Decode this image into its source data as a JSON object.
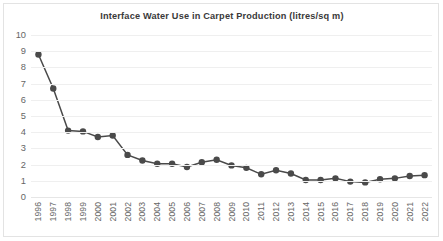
{
  "chart_data": {
    "type": "line",
    "title": "Interface Water Use in Carpet Production (litres/sq m)",
    "xlabel": "",
    "ylabel": "",
    "ylim": [
      0,
      10
    ],
    "yticks": [
      0,
      1,
      2,
      3,
      4,
      5,
      6,
      7,
      8,
      9,
      10
    ],
    "grid": true,
    "legend": false,
    "marker": "circle",
    "series_color": "#4a4a4a",
    "categories": [
      "1996",
      "1997",
      "1998",
      "1999",
      "2000",
      "2001",
      "2002",
      "2003",
      "2004",
      "2005",
      "2006",
      "2007",
      "2008",
      "2009",
      "2010",
      "2011",
      "2012",
      "2013",
      "2014",
      "2015",
      "2016",
      "2017",
      "2018",
      "2019",
      "2020",
      "2021",
      "2022"
    ],
    "values": [
      8.8,
      6.7,
      4.1,
      4.05,
      3.7,
      3.8,
      2.6,
      2.25,
      2.05,
      2.05,
      1.85,
      2.15,
      2.3,
      1.95,
      1.8,
      1.4,
      1.65,
      1.45,
      1.05,
      1.05,
      1.15,
      0.95,
      0.9,
      1.1,
      1.15,
      1.3,
      1.35
    ]
  }
}
